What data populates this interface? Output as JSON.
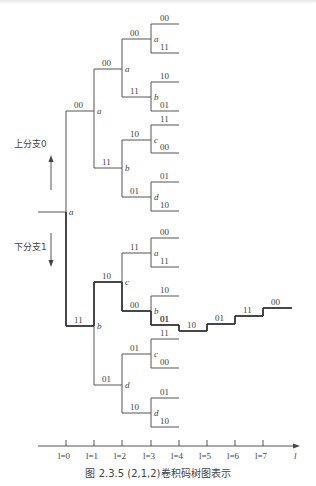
{
  "figure": {
    "caption": "图 2.3.5   (2,1,2)卷积码树图表示",
    "upper_branch_label": "上分支0",
    "lower_branch_label": "下分支1",
    "axis": {
      "var": "l",
      "ticks": [
        "l=0",
        "l=1",
        "l=2",
        "l=3",
        "l=4",
        "l=5",
        "l=6",
        "l=7"
      ],
      "end_label": "l"
    },
    "root": {
      "state": "a"
    },
    "level1": [
      {
        "state": "a",
        "branch": "00"
      },
      {
        "state": "b",
        "branch": "11",
        "highlighted": true
      }
    ],
    "level2": [
      {
        "state": "a",
        "branch": "00"
      },
      {
        "state": "b",
        "branch": "11"
      },
      {
        "state": "c",
        "branch": "10",
        "highlighted": true
      },
      {
        "state": "d",
        "branch": "01"
      }
    ],
    "level3": [
      {
        "state": "a",
        "branch": "00",
        "outputs": [
          "00",
          "11"
        ]
      },
      {
        "state": "b",
        "branch": "11",
        "outputs": [
          "10",
          "01"
        ]
      },
      {
        "state": "c",
        "branch": "10",
        "outputs": [
          "11",
          "00"
        ]
      },
      {
        "state": "d",
        "branch": "01",
        "outputs": [
          "01",
          "10"
        ]
      },
      {
        "state": "a",
        "branch": "11",
        "outputs": [
          "00",
          "11"
        ]
      },
      {
        "state": "b",
        "branch": "00",
        "outputs": [
          "10",
          "01"
        ],
        "highlighted": true
      },
      {
        "state": "c",
        "branch": "01",
        "outputs": [
          "11",
          "00"
        ]
      },
      {
        "state": "d",
        "branch": "10",
        "outputs": [
          "01",
          "10"
        ]
      }
    ],
    "highlighted_path_tail": [
      "01",
      "10",
      "01",
      "11",
      "00"
    ],
    "colors": {
      "line": "#555555",
      "highlight": "#333333",
      "text": "#444444"
    }
  }
}
